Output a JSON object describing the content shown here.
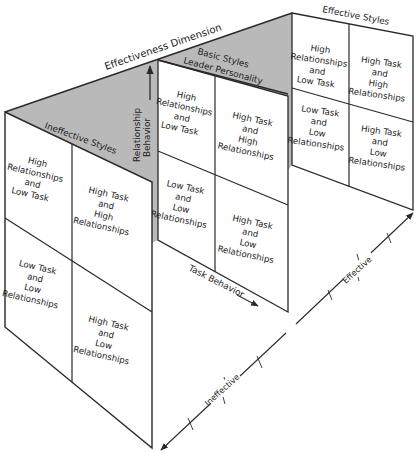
{
  "diagram": {
    "title": "Effectiveness Dimension",
    "colors": {
      "shade": "#b9b9b9",
      "line": "#2a2a2a",
      "panel": "#ffffff"
    },
    "axes": {
      "relationship_behavior": [
        "Relationship",
        "Behavior"
      ],
      "task_behavior": "Task Behavior",
      "effective": "Effective",
      "ineffective": "Ineffective"
    },
    "panels": {
      "effective": {
        "title": "Effective Styles",
        "cells": {
          "top_left": [
            "High",
            "Relationships",
            "and",
            "Low Task"
          ],
          "top_right": [
            "High Task",
            "and",
            "High",
            "Relationships"
          ],
          "bottom_left": [
            "Low Task",
            "and",
            "Low",
            "Relationships"
          ],
          "bottom_right": [
            "High Task",
            "and",
            "Low",
            "Relationships"
          ]
        }
      },
      "basic": {
        "title_line1": "Basic Styles",
        "title_line2": "Leader Personality",
        "cells": {
          "top_left": [
            "High",
            "Relationships",
            "and",
            "Low Task"
          ],
          "top_right": [
            "High Task",
            "and",
            "High",
            "Relationships"
          ],
          "bottom_left": [
            "Low Task",
            "and",
            "Low",
            "Relationships"
          ],
          "bottom_right": [
            "High Task",
            "and",
            "Low",
            "Relationships"
          ]
        }
      },
      "ineffective": {
        "title": "Ineffective Styles",
        "cells": {
          "top_left": [
            "High",
            "Relationships",
            "and",
            "Low Task"
          ],
          "top_right": [
            "High Task",
            "and",
            "High",
            "Relationships"
          ],
          "bottom_left": [
            "Low Task",
            "and",
            "Low",
            "Relationships"
          ],
          "bottom_right": [
            "High Task",
            "and",
            "Low",
            "Relationships"
          ]
        }
      }
    }
  }
}
